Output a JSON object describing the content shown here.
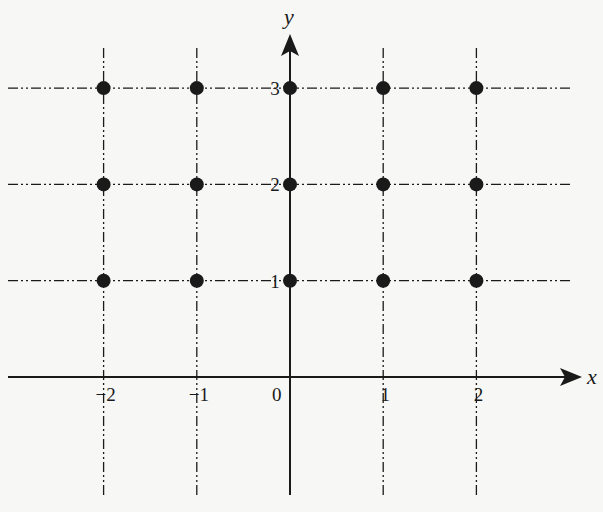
{
  "diagram": {
    "type": "lattice_points_on_coordinate_plane",
    "axes": {
      "x_label": "x",
      "y_label": "y",
      "origin_label": "0",
      "x_ticks": [
        "-2",
        "-1",
        "1",
        "2"
      ],
      "y_ticks": [
        "1",
        "2",
        "3"
      ]
    },
    "grid": {
      "x_values": [
        -2,
        -1,
        0,
        1,
        2
      ],
      "y_values": [
        1,
        2,
        3
      ],
      "line_style": "dash-dot-dot"
    },
    "points": [
      {
        "x": -2,
        "y": 3
      },
      {
        "x": -1,
        "y": 3
      },
      {
        "x": 0,
        "y": 3
      },
      {
        "x": 1,
        "y": 3
      },
      {
        "x": 2,
        "y": 3
      },
      {
        "x": -2,
        "y": 2
      },
      {
        "x": -1,
        "y": 2
      },
      {
        "x": 0,
        "y": 2
      },
      {
        "x": 1,
        "y": 2
      },
      {
        "x": 2,
        "y": 2
      },
      {
        "x": -2,
        "y": 1
      },
      {
        "x": -1,
        "y": 1
      },
      {
        "x": 0,
        "y": 1
      },
      {
        "x": 1,
        "y": 1
      },
      {
        "x": 2,
        "y": 1
      }
    ],
    "colors": {
      "ink": "#1a1a1a",
      "background": "#f7f7f5"
    }
  }
}
